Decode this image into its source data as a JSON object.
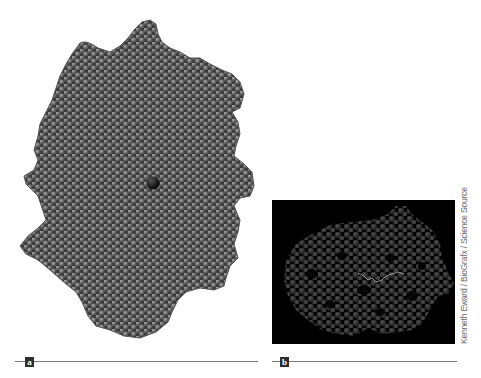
{
  "figure": {
    "panels": [
      {
        "label": "a",
        "description": "Space-filling model of a protein (grey spheres) with a dark central ligand atom"
      },
      {
        "label": "b",
        "description": "Translucent space-filling protein model on black background with bound substrate strand"
      }
    ],
    "credit": "Kenneth Eward / BioGrafx / Science Source"
  },
  "colors": {
    "sphere_fill": "#5a5a5a",
    "sphere_highlight": "#9a9a9a",
    "ligand": "#111111",
    "panel_b_background": "#000000",
    "panel_b_spheres": "#4a4a4a",
    "caption_line": "#7a7a7a",
    "badge_background": "#2e2e2e",
    "credit_text": "#6b6b6b"
  }
}
